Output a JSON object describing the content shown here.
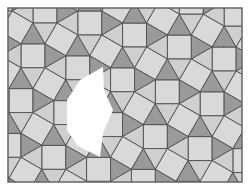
{
  "puzzle": {
    "type": "snub-square-tiling",
    "board": {
      "x": 8,
      "y": 8,
      "width": 234,
      "height": 174
    },
    "edge_length": 24,
    "rotation_deg": 15,
    "origin_offset": [
      16.6,
      27.4
    ],
    "colors": {
      "background": "#ffffff",
      "square": "#d9d9d9",
      "triangle_light": "#cfcfcf",
      "triangle_dark": "#9a9a9a",
      "stroke": "#555555",
      "border": "#666666",
      "hole": "#ffffff"
    },
    "dark_triangles": [
      "T1",
      "T3"
    ],
    "hole_polygon": [
      [
        103,
        67
      ],
      [
        80,
        80
      ],
      [
        67,
        100
      ],
      [
        67,
        130
      ],
      [
        78,
        146
      ],
      [
        100,
        157
      ],
      [
        103,
        133
      ],
      [
        113,
        110
      ],
      [
        104,
        90
      ]
    ]
  }
}
